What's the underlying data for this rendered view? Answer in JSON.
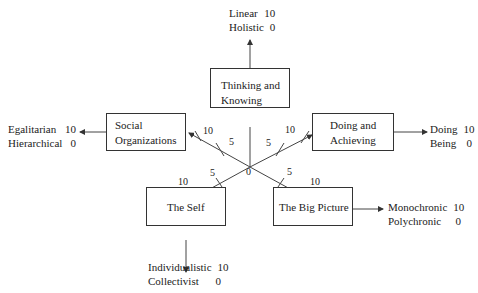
{
  "center_label": "0",
  "dimensions": [
    {
      "id": "thinking",
      "box": "Thinking and Knowing",
      "box_lines": [
        "Thinking and",
        "Knowing"
      ],
      "scale": [
        {
          "label": "Linear",
          "value": "10"
        },
        {
          "label": "Holistic",
          "value": "0"
        }
      ]
    },
    {
      "id": "social",
      "box": "Social Organizations",
      "box_lines": [
        "Social",
        "Organizations"
      ],
      "scale": [
        {
          "label": "Egalitarian",
          "value": "10"
        },
        {
          "label": "Hierarchical",
          "value": "0"
        }
      ]
    },
    {
      "id": "doing",
      "box": "Doing and Achieving",
      "box_lines": [
        "Doing and",
        "Achieving"
      ],
      "scale": [
        {
          "label": "Doing",
          "value": "10"
        },
        {
          "label": "Being",
          "value": "0"
        }
      ]
    },
    {
      "id": "self",
      "box": "The Self",
      "box_lines": [
        "The Self"
      ],
      "scale": [
        {
          "label": "Individualistic",
          "value": "10"
        },
        {
          "label": "Collectivist",
          "value": "0"
        }
      ]
    },
    {
      "id": "bigpicture",
      "box": "The Big Picture",
      "box_lines": [
        "The Big Picture"
      ],
      "scale": [
        {
          "label": "Monochronic",
          "value": "10"
        },
        {
          "label": "Polychronic",
          "value": "0"
        }
      ]
    }
  ],
  "ticks": {
    "five": "5",
    "ten": "10"
  }
}
